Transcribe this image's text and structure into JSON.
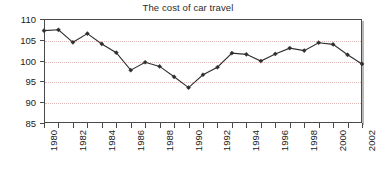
{
  "chart_data": {
    "type": "line",
    "title": "The cost of car travel",
    "xlabel": "",
    "ylabel": "",
    "x": [
      1980,
      1981,
      1982,
      1983,
      1984,
      1985,
      1986,
      1987,
      1988,
      1989,
      1990,
      1991,
      1992,
      1993,
      1994,
      1995,
      1996,
      1997,
      1998,
      1999,
      2000,
      2001,
      2002
    ],
    "values": [
      107.2,
      107.4,
      104.4,
      106.5,
      104.0,
      101.9,
      97.7,
      99.6,
      98.6,
      96.1,
      93.5,
      96.6,
      98.4,
      101.8,
      101.5,
      99.9,
      101.6,
      103.0,
      102.4,
      104.3,
      103.9,
      101.4,
      99.2
    ],
    "series": [
      {
        "name": "Cost index",
        "values": [
          107.2,
          107.4,
          104.4,
          106.5,
          104.0,
          101.9,
          97.7,
          99.6,
          98.6,
          96.1,
          93.5,
          96.6,
          98.4,
          101.8,
          101.5,
          99.9,
          101.6,
          103.0,
          102.4,
          104.3,
          103.9,
          101.4,
          99.2
        ]
      }
    ],
    "ylim": [
      85,
      110
    ],
    "yticks": [
      85,
      90,
      95,
      100,
      105,
      110
    ],
    "ytick_labels": [
      "85",
      "90",
      "95",
      "100",
      "105",
      "110"
    ],
    "xlim": [
      1980,
      2002
    ],
    "xticks": [
      1980,
      1981,
      1982,
      1983,
      1984,
      1985,
      1986,
      1987,
      1988,
      1989,
      1990,
      1991,
      1992,
      1993,
      1994,
      1995,
      1996,
      1997,
      1998,
      1999,
      2000,
      2001,
      2002
    ],
    "xtick_labels": [
      "1980",
      "",
      "1982",
      "",
      "1984",
      "",
      "1986",
      "",
      "1988",
      "",
      "1990",
      "",
      "1992",
      "",
      "1994",
      "",
      "1996",
      "",
      "1998",
      "",
      "2000",
      "",
      "2002"
    ],
    "grid": "horizontal-dotted",
    "legend": "none",
    "marker": "diamond",
    "colors": {
      "line": "#2e2e2e",
      "marker": "#2e2e2e",
      "gridline": "#e2b9b9",
      "axis": "#4a4a4a",
      "background": "#ffffff",
      "text": "#222222"
    }
  }
}
